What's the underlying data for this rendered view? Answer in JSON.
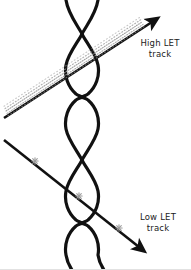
{
  "figure": {
    "width": 191,
    "height": 270,
    "background_color": "#ffffff",
    "stroke_color": "#111111",
    "damage_color": "#9a9a9a"
  },
  "labels": {
    "high_let": {
      "line1": "High LET",
      "line2": "track"
    },
    "low_let": {
      "line1": "Low LET",
      "line2": "track"
    }
  },
  "helix": {
    "name": "dna-double-helix",
    "strand_count": 2,
    "center_x": 82,
    "amplitude": 33,
    "period": 63,
    "stroke_width": 3.2,
    "crossing_y": [
      34,
      97,
      160,
      223
    ]
  },
  "tracks": [
    {
      "id": "high-let-track",
      "label": "High LET track",
      "direction": "up-right",
      "start": [
        4,
        118
      ],
      "end": [
        155,
        20
      ],
      "damage_density": "dense",
      "damage_count": 120,
      "damage_style": "continuous-dense-trail"
    },
    {
      "id": "low-let-track",
      "label": "Low LET track",
      "direction": "down-right",
      "start": [
        4,
        140
      ],
      "end": [
        142,
        250
      ],
      "damage_density": "sparse",
      "damage_count": 3,
      "damage_style": "isolated-spots",
      "damage_points": [
        [
          35,
          161
        ],
        [
          79,
          196
        ],
        [
          119,
          228
        ]
      ]
    }
  ]
}
